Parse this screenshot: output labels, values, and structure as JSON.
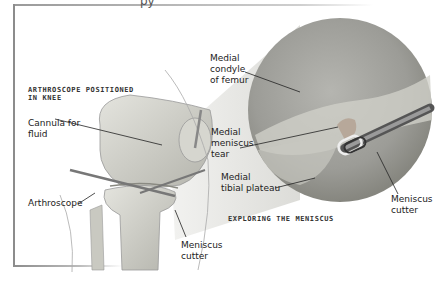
{
  "header": {
    "title_fragment": "py"
  },
  "captions": {
    "left": "ARTHROSCOPE POSITIONED\nIN KNEE",
    "right": "EXPLORING THE MENISCUS"
  },
  "labels": {
    "cannula": "Cannula for\nfluid",
    "arthroscope": "Arthroscope",
    "meniscus_cutter_left": "Meniscus\ncutter",
    "medial_condyle": "Medial\ncondyle\nof femur",
    "medial_meniscus_tear": "Medial\nmeniscus\ntear",
    "medial_tibial_plateau": "Medial\ntibial plateau",
    "meniscus_cutter_right": "Meniscus\ncutter"
  },
  "colors": {
    "bone": "#d9d9d2",
    "bone_shadow": "#a8a8a0",
    "magnifier": "#9d9d98",
    "leader_line": "#222222",
    "frame": "#8c8c8c"
  }
}
